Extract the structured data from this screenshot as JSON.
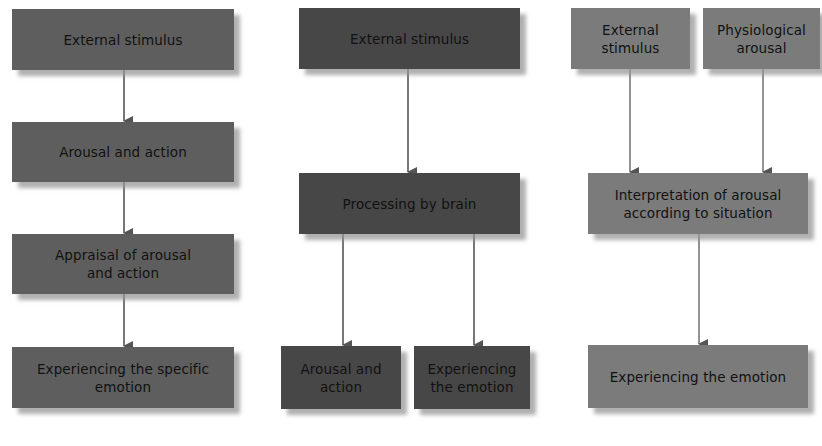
{
  "diagram": {
    "colors": {
      "panel1_box": "#5e5e5e",
      "panel2_box": "#474747",
      "panel3_box": "#7b7b7b",
      "text": "#111111",
      "arrow": "#555555",
      "background": "#ffffff"
    },
    "panels": [
      {
        "id": "panel-1",
        "nodes": [
          {
            "id": "p1-external-stimulus",
            "label": "External stimulus"
          },
          {
            "id": "p1-arousal-action",
            "label": "Arousal and action"
          },
          {
            "id": "p1-appraisal",
            "label": "Appraisal of arousal and action"
          },
          {
            "id": "p1-experiencing",
            "label": "Experiencing the specific emotion"
          }
        ],
        "edges": [
          [
            "p1-external-stimulus",
            "p1-arousal-action"
          ],
          [
            "p1-arousal-action",
            "p1-appraisal"
          ],
          [
            "p1-appraisal",
            "p1-experiencing"
          ]
        ]
      },
      {
        "id": "panel-2",
        "nodes": [
          {
            "id": "p2-external-stimulus",
            "label": "External stimulus"
          },
          {
            "id": "p2-processing",
            "label": "Processing by brain"
          },
          {
            "id": "p2-arousal-action",
            "label": "Arousal and action"
          },
          {
            "id": "p2-experiencing",
            "label": "Experiencing the emotion"
          }
        ],
        "edges": [
          [
            "p2-external-stimulus",
            "p2-processing"
          ],
          [
            "p2-processing",
            "p2-arousal-action"
          ],
          [
            "p2-processing",
            "p2-experiencing"
          ]
        ]
      },
      {
        "id": "panel-3",
        "nodes": [
          {
            "id": "p3-external-stimulus",
            "label": "External stimulus"
          },
          {
            "id": "p3-physiological-arousal",
            "label": "Physiological arousal"
          },
          {
            "id": "p3-interpretation",
            "label": "Interpretation of arousal according to situation"
          },
          {
            "id": "p3-experiencing",
            "label": "Experiencing the emotion"
          }
        ],
        "edges": [
          [
            "p3-external-stimulus",
            "p3-interpretation"
          ],
          [
            "p3-physiological-arousal",
            "p3-interpretation"
          ],
          [
            "p3-interpretation",
            "p3-experiencing"
          ]
        ]
      }
    ]
  }
}
